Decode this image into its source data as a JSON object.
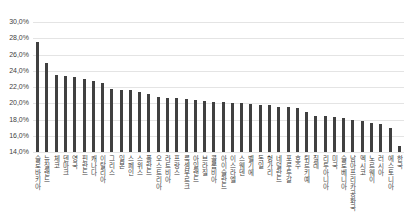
{
  "chart_data": {
    "type": "bar",
    "title": "",
    "xlabel": "",
    "ylabel": "",
    "categories": [
      "슬로바키아",
      "뉴질랜드",
      "체코",
      "덴마크",
      "영국",
      "핀란드",
      "캐나다",
      "이탈리아",
      "그리스",
      "일본",
      "스페인",
      "스위스",
      "폴란드",
      "오스트리아",
      "라트비아",
      "프랑스",
      "룩셈부르크",
      "아일랜드",
      "브라질",
      "콜롬비아",
      "아이슬란드",
      "이스라엘",
      "스웨덴",
      "벨기에",
      "독일",
      "헝가리",
      "네덜란드",
      "포루투갈",
      "호주",
      "튀르키예",
      "칠레",
      "리투아니아",
      "미국",
      "슬로베니아",
      "남아프리카공화국",
      "멕시코",
      "노르웨이",
      "러시아",
      "에스토니아",
      "한국"
    ],
    "values": [
      27.5,
      25.0,
      23.5,
      23.3,
      23.2,
      23.0,
      22.8,
      22.5,
      21.7,
      21.6,
      21.6,
      21.4,
      21.1,
      20.8,
      20.7,
      20.6,
      20.5,
      20.4,
      20.3,
      20.2,
      20.1,
      20.0,
      20.0,
      19.9,
      19.8,
      19.8,
      19.6,
      19.5,
      19.4,
      18.9,
      18.4,
      18.4,
      18.3,
      18.2,
      18.0,
      17.8,
      17.6,
      17.4,
      16.9,
      14.8
    ],
    "ylim": [
      14,
      30
    ],
    "ytick_step": 2,
    "ytick_labels": [
      "30,0%",
      "28,0%",
      "26,0%",
      "24,0%",
      "22,0%",
      "20,0%",
      "18,0%",
      "16,0%",
      "14,0%"
    ],
    "grid": true,
    "legend": false,
    "bar_color": "#404040",
    "gridline_color": "#e4e4e4",
    "axis_text_color": "#3f3f3f"
  }
}
